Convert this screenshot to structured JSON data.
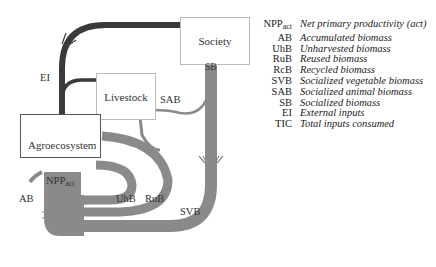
{
  "diagram": {
    "nodes": {
      "society": "Society",
      "livestock": "Livestock",
      "agroecosystem": "Agroecosystem"
    },
    "flow_labels": {
      "ei": "EI",
      "sab": "SAB",
      "sb": "SB",
      "npp_main": "NPP",
      "npp_sub": "act",
      "ab": "AB",
      "uhb": "UhB",
      "rub": "RuB",
      "svb": "SVB"
    },
    "colors": {
      "external_inputs": "#3a3a3a",
      "biomass_flow": "#8a8a8a",
      "box_border": "#bbbbbb",
      "agro_border": "#555555"
    }
  },
  "legend": {
    "items": [
      {
        "abbr_main": "NPP",
        "abbr_sub": "act",
        "desc": "Net primary productivity (act)"
      },
      {
        "abbr_main": "AB",
        "abbr_sub": "",
        "desc": "Accumulated biomass"
      },
      {
        "abbr_main": "UhB",
        "abbr_sub": "",
        "desc": "Unharvested biomass"
      },
      {
        "abbr_main": "RuB",
        "abbr_sub": "",
        "desc": "Reused biomass"
      },
      {
        "abbr_main": "RcB",
        "abbr_sub": "",
        "desc": "Recycled biomass"
      },
      {
        "abbr_main": "SVB",
        "abbr_sub": "",
        "desc": "Socialized vegetable biomass"
      },
      {
        "abbr_main": "SAB",
        "abbr_sub": "",
        "desc": "Socialized animal biomass"
      },
      {
        "abbr_main": "SB",
        "abbr_sub": "",
        "desc": "Socialized biomass"
      },
      {
        "abbr_main": "EI",
        "abbr_sub": "",
        "desc": "External inputs"
      },
      {
        "abbr_main": "TIC",
        "abbr_sub": "",
        "desc": "Total inputs consumed"
      }
    ]
  }
}
